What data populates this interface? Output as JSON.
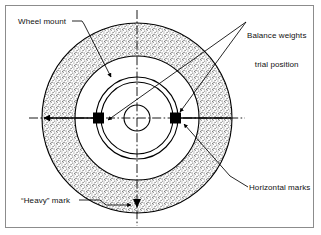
{
  "figure": {
    "background_color": "#ffffff",
    "frame_color": "#8c8c8c",
    "line_color": "#000000",
    "stipple_color": "#6e6e6e"
  },
  "labels": {
    "wheel_mount": "Wheel mount",
    "balance_weights_line1": "Balance weights",
    "balance_weights_line2": "trial position",
    "horizontal_marks": "Horizontal marks",
    "heavy_mark": "“Heavy” mark"
  },
  "geometry": {
    "center_x": 137,
    "center_y": 118,
    "outer_radius": 95,
    "inner_white_radius": 62,
    "ring_outer_radius": 41,
    "ring_inner_radius": 36,
    "hub_radius": 13,
    "weight_size": 10,
    "centerline_extent": 108
  },
  "annotations": {
    "weights_count": 2,
    "left_weight_angle_deg": 180,
    "right_weight_angle_deg": 0,
    "heavy_mark_angle_deg": 270
  }
}
